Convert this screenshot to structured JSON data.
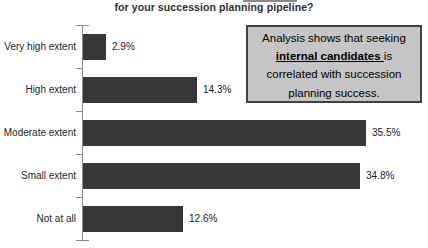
{
  "chart_data": {
    "type": "bar",
    "orientation": "horizontal",
    "title": "for your succession planning pipeline?",
    "categories": [
      "Very high extent",
      "High extent",
      "Moderate extent",
      "Small extent",
      "Not at all"
    ],
    "values": [
      2.9,
      14.3,
      35.5,
      34.8,
      12.6
    ],
    "value_labels": [
      "2.9%",
      "14.3%",
      "35.5%",
      "34.8%",
      "12.6%"
    ],
    "xlabel": "",
    "ylabel": "",
    "xlim": [
      0,
      40
    ],
    "grid": false,
    "legend": "none",
    "bar_color": "#383838",
    "axis_color": "#8a8a8a",
    "label_color": "#262626"
  },
  "annotation": {
    "lines": [
      {
        "text": "Analysis shows that seeking",
        "emphasis": ""
      },
      {
        "text": " is",
        "emphasis": "internal candidates"
      },
      {
        "text": "correlated with succession",
        "emphasis": ""
      },
      {
        "text": "planning success.",
        "emphasis": ""
      }
    ],
    "background": "#c5c5c5",
    "border_color": "#424242"
  }
}
